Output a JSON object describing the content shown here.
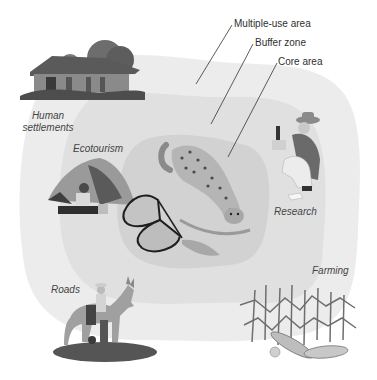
{
  "diagram": {
    "zones": [
      {
        "id": "multiple-use",
        "label": "Multiple-use area",
        "color": "#e9e9e9"
      },
      {
        "id": "buffer",
        "label": "Buffer zone",
        "color": "#dedede"
      },
      {
        "id": "core",
        "label": "Core area",
        "color": "#cfcfcf"
      }
    ],
    "activities": [
      {
        "id": "human-settlements",
        "label_line1": "Human",
        "label_line2": "settlements",
        "illustration": "thatched-house-icon"
      },
      {
        "id": "ecotourism",
        "label": "Ecotourism",
        "illustration": "tent-camper-icon"
      },
      {
        "id": "research",
        "label": "Research",
        "illustration": "researcher-icon"
      },
      {
        "id": "roads",
        "label": "Roads",
        "illustration": "donkey-rider-icon"
      },
      {
        "id": "farming",
        "label": "Farming",
        "illustration": "corn-field-icon"
      }
    ],
    "core_illustrations": [
      "jaguar-icon",
      "butterfly-icon"
    ],
    "background": "#ffffff",
    "text_color": "#3a3a3a"
  }
}
